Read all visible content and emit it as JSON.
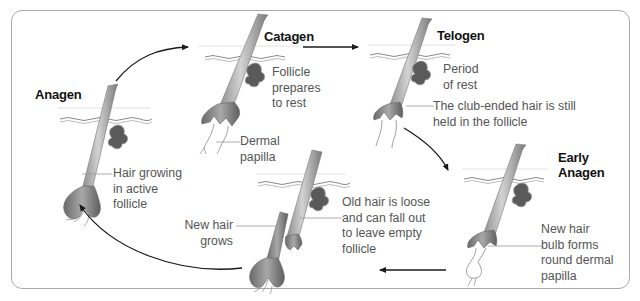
{
  "diagram": {
    "stages": [
      {
        "id": "anagen",
        "label": "Anagen"
      },
      {
        "id": "catagen",
        "label": "Catagen"
      },
      {
        "id": "telogen",
        "label": "Telogen"
      },
      {
        "id": "early-anagen",
        "label_line1": "Early",
        "label_line2": "Anagen"
      }
    ],
    "annotations": {
      "anagen": [
        "Hair growing",
        "in active",
        "follicle"
      ],
      "catagen": [
        "Follicle",
        "prepares",
        "to rest"
      ],
      "catagen_papilla": [
        "Dermal",
        "papilla"
      ],
      "telogen": [
        "Period",
        "of rest"
      ],
      "telogen_club": [
        "The club-ended hair is still",
        "held in the follicle"
      ],
      "early_anagen": [
        "New hair",
        "bulb forms",
        "round dermal",
        "papilla"
      ],
      "shedding_old": [
        "Old hair is loose",
        "and can fall out",
        "to leave empty",
        "follicle"
      ],
      "shedding_new": [
        "New hair",
        "grows"
      ]
    },
    "cycle_order": [
      "Anagen",
      "Catagen",
      "Telogen",
      "Early Anagen",
      "Shedding",
      "Anagen"
    ],
    "colors": {
      "frame": "#a9a9a9",
      "arrow": "#1a1a1a",
      "hair_dark": "#6e6e6e",
      "hair_light": "#c8c8c8",
      "gland": "#5a5a5a",
      "leader_line": "#9a9a9a"
    }
  }
}
